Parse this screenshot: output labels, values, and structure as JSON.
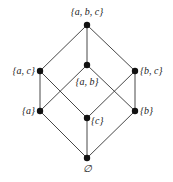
{
  "diagram": {
    "type": "hasse-diagram",
    "nodes": [
      {
        "id": "abc",
        "label": "{a, b, c}",
        "x": 87,
        "y": 25,
        "lx": 87,
        "ly": 15,
        "anchor": "middle"
      },
      {
        "id": "ac",
        "label": "{a, c}",
        "x": 40,
        "y": 71,
        "lx": 35,
        "ly": 74,
        "anchor": "end"
      },
      {
        "id": "ab",
        "label": "{a, b}",
        "x": 87,
        "y": 65,
        "lx": 87,
        "ly": 85,
        "anchor": "middle"
      },
      {
        "id": "bc",
        "label": "{b, c}",
        "x": 135,
        "y": 71,
        "lx": 140,
        "ly": 74,
        "anchor": "start"
      },
      {
        "id": "a",
        "label": "{a}",
        "x": 40,
        "y": 111,
        "lx": 35,
        "ly": 114,
        "anchor": "end"
      },
      {
        "id": "c",
        "label": "{c}",
        "x": 87,
        "y": 118,
        "lx": 91,
        "ly": 124,
        "anchor": "start"
      },
      {
        "id": "b",
        "label": "{b}",
        "x": 135,
        "y": 111,
        "lx": 140,
        "ly": 114,
        "anchor": "start"
      },
      {
        "id": "empty",
        "label": "∅",
        "x": 87,
        "y": 158,
        "lx": 87,
        "ly": 172,
        "anchor": "middle"
      }
    ],
    "edges": [
      [
        "abc",
        "ac"
      ],
      [
        "abc",
        "ab"
      ],
      [
        "abc",
        "bc"
      ],
      [
        "ac",
        "a"
      ],
      [
        "ac",
        "c"
      ],
      [
        "ab",
        "a"
      ],
      [
        "ab",
        "b"
      ],
      [
        "bc",
        "c"
      ],
      [
        "bc",
        "b"
      ],
      [
        "a",
        "empty"
      ],
      [
        "c",
        "empty"
      ],
      [
        "b",
        "empty"
      ]
    ]
  }
}
